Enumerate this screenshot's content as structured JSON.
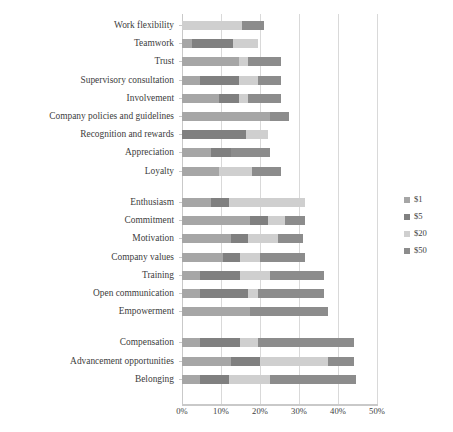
{
  "chart_data": {
    "type": "bar",
    "subtype": "horizontal-stacked-bar",
    "title": "",
    "xlabel": "",
    "ylabel": "",
    "xlim": [
      0,
      50
    ],
    "x_tick_labels": [
      "0%",
      "10%",
      "20%",
      "30%",
      "40%",
      "50%"
    ],
    "x_ticks": [
      0,
      10,
      20,
      30,
      40,
      50
    ],
    "grid": true,
    "legend_position": "right",
    "value_unit": "percent",
    "categories": [
      "Work flexibility",
      "Teamwork",
      "Trust",
      "Supervisory consultation",
      "Involvement",
      "Company policies and guidelines",
      "Recognition and rewards",
      "Appreciation",
      "Loyalty",
      "Enthusiasm",
      "Commitment",
      "Motivation",
      "Company values",
      "Training",
      "Open communication",
      "Empowerment",
      "Compensation",
      "Advancement opportunities",
      "Belonging"
    ],
    "group_breaks_after": [
      "Loyalty",
      "Empowerment"
    ],
    "series": [
      {
        "name": "$1",
        "color": "#a6a6a6",
        "values": [
          0,
          2.5,
          14.5,
          4.5,
          9.5,
          22.5,
          0,
          7.5,
          9.5,
          7.5,
          17.5,
          12.5,
          10.5,
          4.5,
          4.5,
          17.5,
          4.5,
          12.5,
          4.5
        ]
      },
      {
        "name": "$5",
        "color": "#808080",
        "values": [
          0,
          10.5,
          0,
          10,
          5,
          0,
          16.5,
          5,
          0,
          4.5,
          4.5,
          4.5,
          4.5,
          10.5,
          12.5,
          0,
          10.5,
          7.5,
          7.5
        ]
      },
      {
        "name": "$20",
        "color": "#cfcfcf",
        "values": [
          15.5,
          6.5,
          2.5,
          5,
          2.5,
          0,
          5.5,
          0,
          8.5,
          19.5,
          4.5,
          7.5,
          5,
          7.5,
          2.5,
          0,
          4.5,
          17.5,
          10.5
        ]
      },
      {
        "name": "$50",
        "color": "#8c8c8c",
        "values": [
          5.5,
          0,
          8.5,
          6,
          8.5,
          5,
          0,
          10,
          7.5,
          0,
          5,
          6.5,
          11.5,
          14,
          17,
          20,
          24.5,
          6.5,
          22
        ]
      }
    ],
    "legend_entries": [
      {
        "label": "$1",
        "color": "#a6a6a6"
      },
      {
        "label": "$5",
        "color": "#808080"
      },
      {
        "label": "$20",
        "color": "#cfcfcf"
      },
      {
        "label": "$50",
        "color": "#8c8c8c"
      }
    ]
  },
  "axis": {
    "x_label_0": "0%",
    "x_label_1": "10%",
    "x_label_2": "20%",
    "x_label_3": "30%",
    "x_label_4": "40%",
    "x_label_5": "50%"
  }
}
